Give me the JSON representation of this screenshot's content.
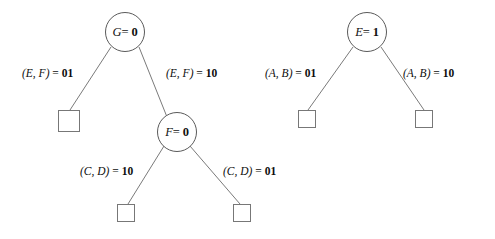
{
  "figure": {
    "background_color": "#ffffff",
    "stroke_color": "#6b6b6b",
    "text_color": "#111111"
  },
  "trees": [
    {
      "id": "left-tree",
      "root": {
        "name": "node-g",
        "variable": "G",
        "equals": "=",
        "value": "0",
        "shape": "circle",
        "cx": 125,
        "cy": 32,
        "r": 20
      },
      "internal_nodes": [
        {
          "name": "node-f",
          "variable": "F",
          "equals": "=",
          "value": "0",
          "shape": "circle",
          "cx": 177,
          "cy": 132,
          "r": 20
        }
      ],
      "leaves": [
        {
          "name": "leaf-g-left",
          "shape": "square",
          "x": 58,
          "y": 110,
          "size": 22
        },
        {
          "name": "leaf-f-left",
          "shape": "square",
          "x": 117,
          "y": 204,
          "size": 18
        },
        {
          "name": "leaf-f-right",
          "shape": "square",
          "x": 233,
          "y": 204,
          "size": 18
        }
      ],
      "edges": [
        {
          "name": "edge-g-left",
          "from": "node-g",
          "to": "leaf-g-left",
          "x1": 111,
          "y1": 47,
          "x2": 70,
          "y2": 110,
          "label": {
            "vars": "(E, F)",
            "equals": "=",
            "bits": "01",
            "x": 22,
            "y": 68
          }
        },
        {
          "name": "edge-g-right",
          "from": "node-g",
          "to": "node-f",
          "x1": 139,
          "y1": 47,
          "x2": 167,
          "y2": 117,
          "label": {
            "vars": "(E, F)",
            "equals": "=",
            "bits": "10",
            "x": 166,
            "y": 68
          }
        },
        {
          "name": "edge-f-left",
          "from": "node-f",
          "to": "leaf-f-left",
          "x1": 164,
          "y1": 146,
          "x2": 128,
          "y2": 204,
          "label": {
            "vars": "(C, D)",
            "equals": "=",
            "bits": "10",
            "x": 80,
            "y": 166
          }
        },
        {
          "name": "edge-f-right",
          "from": "node-f",
          "to": "leaf-f-right",
          "x1": 190,
          "y1": 146,
          "x2": 240,
          "y2": 204,
          "label": {
            "vars": "(C, D)",
            "equals": "=",
            "bits": "01",
            "x": 223,
            "y": 166
          }
        }
      ]
    },
    {
      "id": "right-tree",
      "root": {
        "name": "node-e",
        "variable": "E",
        "equals": "=",
        "value": "1",
        "shape": "circle",
        "cx": 367,
        "cy": 32,
        "r": 20
      },
      "internal_nodes": [],
      "leaves": [
        {
          "name": "leaf-e-left",
          "shape": "square",
          "x": 298,
          "y": 110,
          "size": 18
        },
        {
          "name": "leaf-e-right",
          "shape": "square",
          "x": 415,
          "y": 110,
          "size": 18
        }
      ],
      "edges": [
        {
          "name": "edge-e-left",
          "from": "node-e",
          "to": "leaf-e-left",
          "x1": 353,
          "y1": 47,
          "x2": 308,
          "y2": 110,
          "label": {
            "vars": "(A, B)",
            "equals": "=",
            "bits": "01",
            "x": 265,
            "y": 68
          }
        },
        {
          "name": "edge-e-right",
          "from": "node-e",
          "to": "leaf-e-right",
          "x1": 381,
          "y1": 47,
          "x2": 424,
          "y2": 110,
          "label": {
            "vars": "(A, B)",
            "equals": "=",
            "bits": "10",
            "x": 403,
            "y": 68
          }
        }
      ]
    }
  ]
}
